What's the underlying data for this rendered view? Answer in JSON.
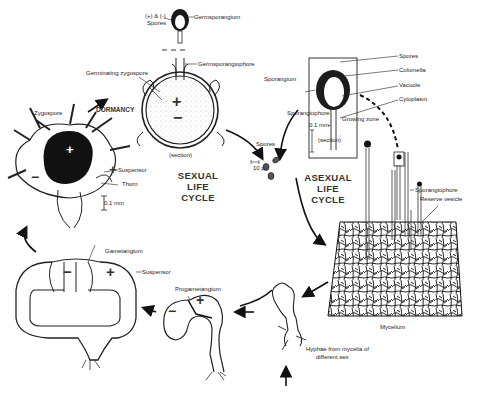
{
  "title_sexual": [
    "SEXUAL",
    "LIFE",
    "CYCLE"
  ],
  "title_asexual": [
    "ASEXUAL",
    "LIFE",
    "CYCLE"
  ],
  "labels": {
    "spores_pm": "(+) & (-)",
    "spores_pm2": "Spores",
    "germsporangium": "Germsporangium",
    "germsporangiophore": "Germsporangiophore",
    "germinating_zygospore": "Germinating zygospore",
    "section_sexual": "(section)",
    "dormancy": "DORMANCY",
    "zygospore": "Zygospore",
    "suspensor_zygo": "Suspensor",
    "thorn": "Thorn",
    "scale_zygo": "0.1 mm",
    "gametangium": "Gametangium",
    "suspensor_gam": "Suspensor",
    "progametangium": "Progametangium",
    "hyphae_line1": "Hyphae from mycelia of",
    "hyphae_line2": "different sex",
    "mycelium": "Mycelium",
    "spores_center": "Spores",
    "spore_scale": "10 μ",
    "sporangium": "Sporangium",
    "spores_asex": "Spores",
    "columella": "Columella",
    "vacuole": "Vacuole",
    "cytoplasm": "Cytoplasm",
    "sporangiophore_inset": "Sporangiophore",
    "growing_zone": "Growing zone",
    "scale_inset": "0.1 mm",
    "section_asexual": "(section)",
    "sporangiophore": "Sporangiophore",
    "reserve_vesicle": "Reserve vesicle"
  },
  "signs": {
    "plus": "+",
    "minus": "−"
  },
  "colors": {
    "ink": "#1a1a1a",
    "background": "#ffffff",
    "stipple": "#9a9a9a"
  }
}
